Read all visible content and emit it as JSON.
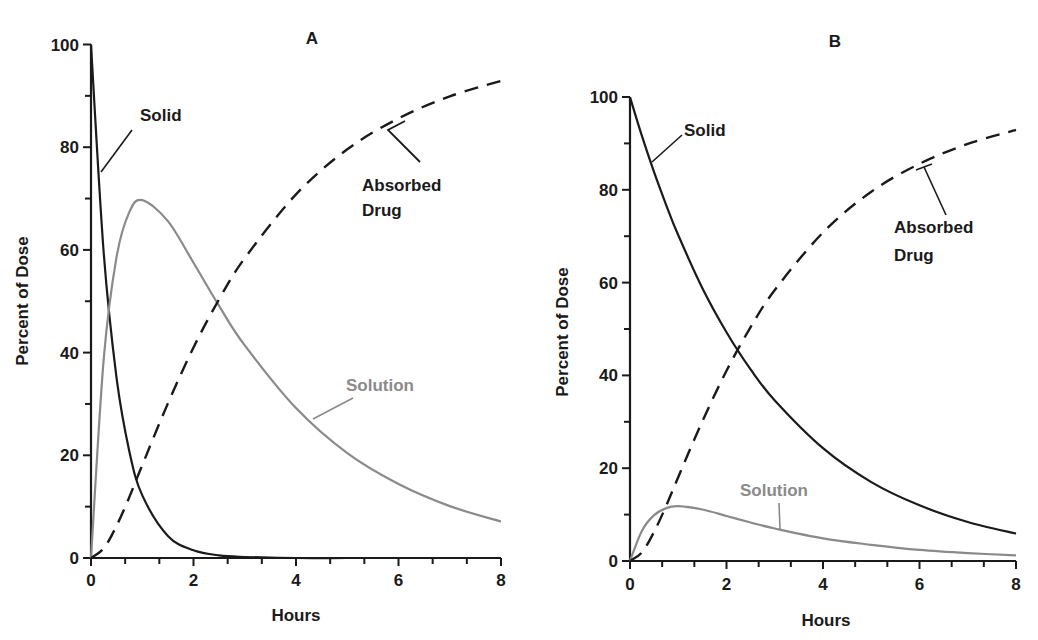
{
  "figure": {
    "panels": [
      "A",
      "B"
    ]
  },
  "chart_data": [
    {
      "type": "line",
      "title": "A",
      "xlabel": "Hours",
      "ylabel": "Percent of Dose",
      "xlim": [
        0,
        8
      ],
      "ylim": [
        0,
        100
      ],
      "x_ticks": [
        0,
        2,
        4,
        6,
        8
      ],
      "y_ticks": [
        0,
        20,
        40,
        60,
        80,
        100
      ],
      "x_minor_step": 0.6667,
      "y_minor_step": 10,
      "grid": false,
      "legend": "inline labels",
      "x": [
        0,
        0.25,
        0.5,
        0.75,
        1,
        1.5,
        2,
        2.5,
        3,
        4,
        5,
        6,
        7,
        8
      ],
      "series": [
        {
          "name": "Solid",
          "style": "solid",
          "color": "#1a1a1a",
          "values": [
            100,
            59.2,
            35.0,
            20.7,
            12.2,
            4.3,
            1.5,
            0.5,
            0.2,
            0.0,
            0,
            0,
            0,
            0
          ]
        },
        {
          "name": "Solution",
          "style": "solid",
          "color": "#8a8a8a",
          "values": [
            0,
            38.9,
            58.7,
            67.4,
            69.7,
            65.6,
            57.5,
            49.1,
            41.4,
            29.2,
            20.4,
            14.4,
            10.1,
            7.1
          ]
        },
        {
          "name": "Absorbed Drug",
          "style": "dashed",
          "color": "#1a1a1a",
          "values": [
            0,
            1.9,
            6.3,
            11.9,
            18.1,
            30.1,
            41.0,
            50.4,
            58.4,
            70.8,
            79.6,
            85.6,
            89.9,
            92.9
          ]
        }
      ],
      "annotations": [
        {
          "text": "Solid",
          "lines": [
            "Solid"
          ]
        },
        {
          "text": "Absorbed Drug",
          "lines": [
            "Absorbed",
            "Drug"
          ]
        },
        {
          "text": "Solution",
          "lines": [
            "Solution"
          ]
        }
      ]
    },
    {
      "type": "line",
      "title": "B",
      "xlabel": "Hours",
      "ylabel": "Percent of Dose",
      "xlim": [
        0,
        8
      ],
      "ylim": [
        0,
        100
      ],
      "x_ticks": [
        0,
        2,
        4,
        6,
        8
      ],
      "y_ticks": [
        0,
        20,
        40,
        60,
        80,
        100
      ],
      "x_minor_step": 0.6667,
      "y_minor_step": 10,
      "grid": false,
      "legend": "inline labels",
      "x": [
        0,
        0.25,
        0.5,
        0.75,
        1,
        1.5,
        2,
        2.5,
        3,
        4,
        5,
        6,
        7,
        8
      ],
      "series": [
        {
          "name": "Solid",
          "style": "solid",
          "color": "#1a1a1a",
          "values": [
            100,
            91.5,
            83.8,
            76.7,
            70.2,
            58.8,
            49.3,
            41.3,
            34.6,
            24.3,
            17.0,
            12.0,
            8.4,
            5.9
          ]
        },
        {
          "name": "Solution",
          "style": "solid",
          "color": "#8a8a8a",
          "values": [
            0,
            6.6,
            9.9,
            11.4,
            11.8,
            11.1,
            9.7,
            8.3,
            7.0,
            4.9,
            3.5,
            2.4,
            1.7,
            1.2
          ]
        },
        {
          "name": "Absorbed Drug",
          "style": "dashed",
          "color": "#1a1a1a",
          "values": [
            0,
            1.9,
            6.3,
            11.9,
            18.1,
            30.1,
            41.0,
            50.4,
            58.4,
            70.8,
            79.6,
            85.6,
            89.9,
            92.9
          ]
        }
      ],
      "annotations": [
        {
          "text": "Solid",
          "lines": [
            "Solid"
          ]
        },
        {
          "text": "Absorbed Drug",
          "lines": [
            "Absorbed",
            "Drug"
          ]
        },
        {
          "text": "Solution",
          "lines": [
            "Solution"
          ]
        }
      ]
    }
  ]
}
